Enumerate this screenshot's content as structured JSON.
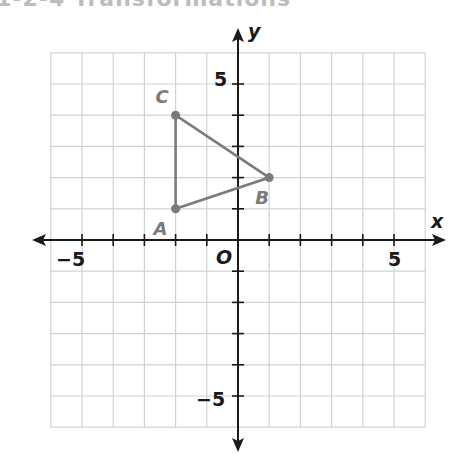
{
  "header": {
    "cut_title": "1-2-4 Transformations"
  },
  "chart_data": {
    "type": "scatter",
    "title": "",
    "xlabel": "x",
    "ylabel": "y",
    "xlim": [
      -6,
      6
    ],
    "ylim": [
      -6,
      6
    ],
    "grid": true,
    "origin_label": "O",
    "tick_labels": {
      "x": [
        "-5",
        "5"
      ],
      "y": [
        "5",
        "-5"
      ]
    },
    "tick_labels_display": {
      "x_neg": "−5",
      "x_pos": "5",
      "y_pos": "5",
      "y_neg": "−5"
    },
    "points": [
      {
        "label": "A",
        "x": -2,
        "y": 1
      },
      {
        "label": "B",
        "x": 1,
        "y": 2
      },
      {
        "label": "C",
        "x": -2,
        "y": 4
      }
    ],
    "polygon": [
      "A",
      "B",
      "C"
    ],
    "colors": {
      "triangle": "#7a7a7a",
      "axes": "#1a1a1a",
      "grid": "#d2d2d2"
    }
  }
}
